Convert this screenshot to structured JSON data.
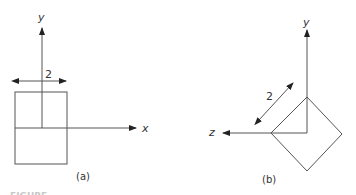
{
  "figure_a": {
    "axis_labels": {
      "y": "y",
      "x": "x"
    },
    "dimension_label": "2",
    "caption": "(a)",
    "shape": "square, edge-on view"
  },
  "figure_b": {
    "axis_labels": {
      "y": "y",
      "z": "z"
    },
    "dimension_label": "2",
    "caption": "(b)",
    "shape": "square rotated 45 degrees"
  },
  "figure_caption_partial": "FIGURE"
}
